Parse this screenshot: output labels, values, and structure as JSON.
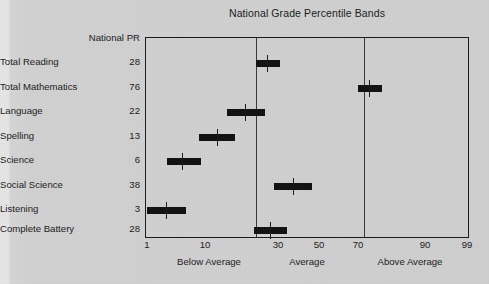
{
  "page": {
    "background_color": "#d2d2d2",
    "ink_color": "#111111"
  },
  "chart": {
    "title": "National Grade Percentile Bands",
    "column_header": "National PR"
  },
  "axis": {
    "tick_labels": [
      "1",
      "10",
      "30",
      "50",
      "70",
      "90",
      "99"
    ],
    "tick_values": [
      1,
      10,
      30,
      50,
      70,
      90,
      99
    ],
    "tick_x_px": [
      147,
      205,
      278,
      319,
      358,
      425,
      467
    ],
    "zones": [
      {
        "label": "Below Average",
        "center_x_px": 209
      },
      {
        "label": "Average",
        "center_x_px": 307
      },
      {
        "label": "Above Average",
        "center_x_px": 410
      }
    ],
    "divider_x_px": [
      255,
      363
    ]
  },
  "chart_data": {
    "type": "bar",
    "title": "National Grade Percentile Bands",
    "xlabel": "",
    "ylabel": "",
    "orientation": "horizontal-ranges",
    "xlim": [
      1,
      99
    ],
    "xticks": [
      1,
      10,
      30,
      50,
      70,
      90,
      99
    ],
    "grid": false,
    "legend": null,
    "value_column_header": "National PR",
    "categories": [
      "Total Reading",
      "Total Mathematics",
      "Language",
      "Spelling",
      "Science",
      "Social Science",
      "Listening",
      "Complete Battery"
    ],
    "values": [
      28,
      76,
      22,
      13,
      6,
      38,
      3,
      28
    ],
    "rows": [
      {
        "label": "Total Reading",
        "value": 28,
        "row_y_px": 62,
        "band_x0_px": 255,
        "band_x1_px": 279,
        "tick_x_px": 266
      },
      {
        "label": "Total Mathematics",
        "value": 76,
        "row_y_px": 87,
        "band_x0_px": 357,
        "band_x1_px": 381,
        "tick_x_px": 368
      },
      {
        "label": "Language",
        "value": 22,
        "row_y_px": 111,
        "band_x0_px": 226,
        "band_x1_px": 264,
        "tick_x_px": 244
      },
      {
        "label": "Spelling",
        "value": 13,
        "row_y_px": 136,
        "band_x0_px": 198,
        "band_x1_px": 234,
        "tick_x_px": 216
      },
      {
        "label": "Science",
        "value": 6,
        "row_y_px": 160,
        "band_x0_px": 166,
        "band_x1_px": 200,
        "tick_x_px": 181
      },
      {
        "label": "Social Science",
        "value": 38,
        "row_y_px": 185,
        "band_x0_px": 273,
        "band_x1_px": 311,
        "tick_x_px": 292
      },
      {
        "label": "Listening",
        "value": 3,
        "row_y_px": 209,
        "band_x0_px": 146,
        "band_x1_px": 185,
        "tick_x_px": 165
      },
      {
        "label": "Complete Battery",
        "value": 28,
        "row_y_px": 229,
        "band_x0_px": 253,
        "band_x1_px": 286,
        "tick_x_px": 269
      }
    ],
    "zone_bands": [
      {
        "name": "Below Average",
        "range": [
          1,
          22
        ]
      },
      {
        "name": "Average",
        "range": [
          23,
          77
        ]
      },
      {
        "name": "Above Average",
        "range": [
          78,
          99
        ]
      }
    ]
  }
}
